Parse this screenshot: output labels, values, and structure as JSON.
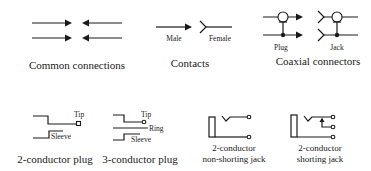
{
  "diagram": {
    "groups": {
      "common": {
        "caption": "Common connections"
      },
      "contacts": {
        "caption": "Contacts",
        "male_label": "Male",
        "female_label": "Female"
      },
      "coaxial": {
        "caption": "Coaxial connectors",
        "plug_label": "Plug",
        "jack_label": "Jack"
      },
      "plug2": {
        "caption": "2-conductor plug",
        "tip_label": "Tip",
        "sleeve_label": "Sleeve"
      },
      "plug3": {
        "caption": "3-conductor plug",
        "tip_label": "Tip",
        "ring_label": "Ring",
        "sleeve_label": "Sleeve"
      },
      "jack_nonshort": {
        "caption_line1": "2-conductor",
        "caption_line2": "non-shorting jack"
      },
      "jack_short": {
        "caption_line1": "2-conductor",
        "caption_line2": "shorting jack"
      }
    },
    "colors": {
      "ink": "#1a1a1a",
      "background": "#ffffff"
    }
  }
}
